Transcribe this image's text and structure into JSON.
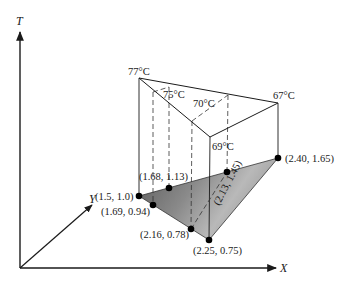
{
  "diagram": {
    "type": "3d-temperature-surface-over-xy-triangle",
    "axes": {
      "t_label": "T",
      "x_label": "X",
      "y_label": "Y"
    },
    "temperatures": {
      "t77": "77°C",
      "t75": "75°C",
      "t70": "70°C",
      "t69": "69°C",
      "t67": "67°C"
    },
    "base_points": {
      "p1": "(1.5, 1.0)",
      "p2": "(1.69, 0.94)",
      "p3": "(1.68, 1.13)",
      "p4": "(2.16, 0.78)",
      "p5": "(2.25, 0.75)",
      "p6": "(2.13, 1.45)",
      "p7": "(2.40, 1.65)"
    },
    "colors": {
      "line": "#1a1a1a",
      "triangle_light": "#d9d9d9",
      "triangle_dark": "#6e6e6e",
      "point": "#000000"
    }
  }
}
